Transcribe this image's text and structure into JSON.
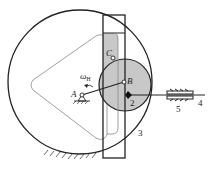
{
  "diagram": {
    "type": "mechanism",
    "labels": {
      "A": "A",
      "B": "B",
      "C": "C",
      "omega": "ω",
      "omega_sub": "H",
      "part2": "2",
      "part3": "3",
      "part4": "4",
      "part5": "5"
    },
    "colors": {
      "stroke": "#222222",
      "fill_gray": "#c8c8c8",
      "light_line": "#888888"
    }
  }
}
